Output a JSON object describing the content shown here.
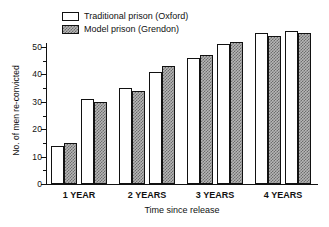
{
  "chart_data": {
    "type": "bar",
    "title": "",
    "xlabel": "Time since release",
    "ylabel": "No. of men re-convicted",
    "categories": [
      "1 YEAR",
      "2 YEARS",
      "3 YEARS",
      "4 YEARS"
    ],
    "series": [
      {
        "name": "Traditional prison (Oxford)",
        "values": [
          14,
          35,
          46,
          55
        ]
      },
      {
        "name": "Model prison (Grendon)",
        "values": [
          15,
          34,
          47,
          54
        ]
      }
    ],
    "extra_bars_note": "Each labelled year group is drawn as two adjacent pairs of bars (8 pairs total across the axis).",
    "bar_pairs": [
      {
        "group": "1 YEAR",
        "light": 14,
        "hatched": 15
      },
      {
        "group": "1 YEAR",
        "light": 31,
        "hatched": 30
      },
      {
        "group": "2 YEARS",
        "light": 35,
        "hatched": 34
      },
      {
        "group": "2 YEARS",
        "light": 41,
        "hatched": 43
      },
      {
        "group": "3 YEARS",
        "light": 46,
        "hatched": 47
      },
      {
        "group": "3 YEARS",
        "light": 51,
        "hatched": 52
      },
      {
        "group": "4 YEARS",
        "light": 55,
        "hatched": 54
      },
      {
        "group": "4 YEARS",
        "light": 56,
        "hatched": 55
      }
    ],
    "ylim": [
      0,
      58
    ],
    "yticks": [
      0,
      10,
      20,
      30,
      40,
      50
    ],
    "ytick_labels": [
      "0",
      "10",
      "20",
      "30",
      "40",
      "50"
    ],
    "yminor_ticks": [
      5,
      15,
      25,
      35,
      45,
      55
    ],
    "grid": false,
    "legend_position": "top-left",
    "colors": {
      "axis": "#111111",
      "light_bar_fill": "#ffffff",
      "hatched_bar_fill": "#b6b6b6",
      "hatched_bar_pattern": "#6d6d6d",
      "background": "#ffffff"
    }
  },
  "legend": {
    "items": [
      {
        "label": "Traditional prison (Oxford)",
        "swatch": "light"
      },
      {
        "label": "Model prison (Grendon)",
        "swatch": "hatched"
      }
    ]
  },
  "axes": {
    "y_title": "No. of men re-convicted",
    "x_title": "Time since release"
  }
}
